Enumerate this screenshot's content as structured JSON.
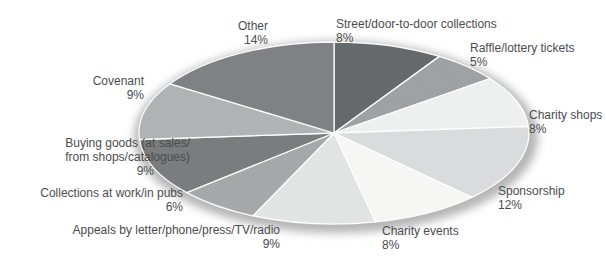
{
  "chart_data": {
    "type": "pie",
    "title": "",
    "unit": "%",
    "total_shown_pct": 88,
    "start_angle_deg": 0,
    "direction": "clockwise",
    "divider_color": "#ffffff",
    "shadow_color": "#b6b6b6",
    "label_text_color": "#4a4d4f",
    "slices": [
      {
        "id": "street",
        "label": "Street/door-to-door collections",
        "lines": [
          "Street/door-to-door collections"
        ],
        "value": 8,
        "pct_text": "8%",
        "color": "#66696c",
        "textured": false
      },
      {
        "id": "raffle",
        "label": "Raffle/lottery tickets",
        "lines": [
          "Raffle/lottery tickets"
        ],
        "value": 5,
        "pct_text": "5%",
        "color": "#a0a3a5",
        "textured": true
      },
      {
        "id": "charity_shops",
        "label": "Charity shops",
        "lines": [
          "Charity shops"
        ],
        "value": 8,
        "pct_text": "8%",
        "color": "#eeefef",
        "textured": false
      },
      {
        "id": "sponsorship",
        "label": "Sponsorship",
        "lines": [
          "Sponsorship"
        ],
        "value": 12,
        "pct_text": "12%",
        "color": "#dadbdc",
        "textured": false
      },
      {
        "id": "charity_events",
        "label": "Charity events",
        "lines": [
          "Charity events"
        ],
        "value": 8,
        "pct_text": "8%",
        "color": "#f6f6f5",
        "textured": false
      },
      {
        "id": "appeals",
        "label": "Appeals by letter/phone/press/TV/radio",
        "lines": [
          "Appeals by letter/phone/press/TV/radio"
        ],
        "value": 9,
        "pct_text": "9%",
        "color": "#e2e3e3",
        "textured": false
      },
      {
        "id": "collections_work_pubs",
        "label": "Collections at work/in pubs",
        "lines": [
          "Collections at work/in pubs"
        ],
        "value": 6,
        "pct_text": "6%",
        "color": "#a7a9ab",
        "textured": true
      },
      {
        "id": "buying_goods",
        "label": "Buying goods (at sales/ from shops/catalogues)",
        "lines": [
          "Buying goods (at sales/",
          "from shops/catalogues)"
        ],
        "value": 9,
        "pct_text": "9%",
        "color": "#7b7d7f",
        "textured": true
      },
      {
        "id": "covenant",
        "label": "Covenant",
        "lines": [
          "Covenant"
        ],
        "value": 9,
        "pct_text": "9%",
        "color": "#b2b4b5",
        "textured": true
      },
      {
        "id": "other",
        "label": "Other",
        "lines": [
          "Other"
        ],
        "value": 14,
        "pct_text": "14%",
        "color": "#808285",
        "textured": true
      }
    ]
  }
}
